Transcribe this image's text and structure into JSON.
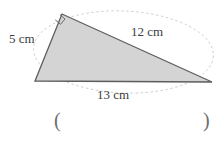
{
  "figure": {
    "type": "right-triangle-with-circumscribed-ellipse",
    "fill_color": "#d4d4d4",
    "stroke_color": "#5a5a5a",
    "guide_color": "#b9b9b9",
    "vertices": {
      "left": [
        35,
        81
      ],
      "top": [
        62,
        14
      ],
      "right": [
        212,
        82
      ]
    },
    "right_angle_at": "top",
    "right_angle_marker": "square"
  },
  "labels": {
    "side_a": {
      "value": "5",
      "unit": "cm",
      "text": "5 cm"
    },
    "side_b": {
      "value": "12",
      "unit": "cm",
      "text": "12 cm"
    },
    "side_c": {
      "value": "13",
      "unit": "cm",
      "text": "13 cm"
    }
  },
  "answer": {
    "paren_open": "(",
    "paren_close": ")",
    "value": ""
  }
}
